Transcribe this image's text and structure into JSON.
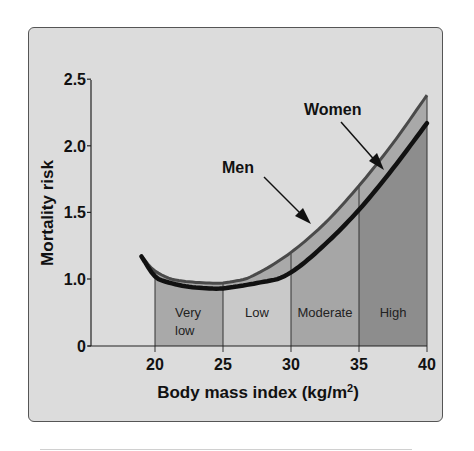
{
  "chart_data": {
    "type": "line",
    "title": "",
    "xlabel": "Body mass index (kg/m²)",
    "xlabel_main": "Body mass index (kg/m",
    "xlabel_sup": "2",
    "xlabel_close": ")",
    "ylabel": "Mortality risk",
    "xlim": [
      19,
      40
    ],
    "ylim": [
      0,
      2.5
    ],
    "grid": false,
    "x_ticks": [
      "20",
      "25",
      "30",
      "35",
      "40"
    ],
    "x_tick_values": [
      20,
      25,
      30,
      35,
      40
    ],
    "y_ticks": [
      "0",
      "1.0",
      "1.5",
      "2.0",
      "2.5"
    ],
    "y_tick_values": [
      0,
      1.0,
      1.5,
      2.0,
      2.5
    ],
    "x": [
      19,
      20,
      22,
      24,
      25,
      27.5,
      30,
      32.5,
      35,
      37.5,
      40
    ],
    "series": [
      {
        "name": "Men",
        "values": [
          1.17,
          1.06,
          0.97,
          0.94,
          0.94,
          1.04,
          1.2,
          1.42,
          1.7,
          2.02,
          2.38
        ],
        "color": "#4a4a4a"
      },
      {
        "name": "Women",
        "values": [
          1.17,
          1.02,
          0.9,
          0.86,
          0.86,
          0.94,
          1.05,
          1.26,
          1.52,
          1.83,
          2.17
        ],
        "color": "#111111"
      }
    ],
    "regions": [
      {
        "label": "Very low",
        "label_lines": [
          "Very",
          "low"
        ],
        "x_start": 20,
        "x_end": 25,
        "color": "#a9a9a9"
      },
      {
        "label": "Low",
        "label_lines": [
          "Low"
        ],
        "x_start": 25,
        "x_end": 30,
        "color": "#c9c9c9"
      },
      {
        "label": "Moderate",
        "label_lines": [
          "Moderate"
        ],
        "x_start": 30,
        "x_end": 35,
        "color": "#a6a6a6"
      },
      {
        "label": "High",
        "label_lines": [
          "High"
        ],
        "x_start": 35,
        "x_end": 40,
        "color": "#8d8d8d"
      }
    ],
    "annotations": [
      {
        "text": "Men",
        "points_to": "Men"
      },
      {
        "text": "Women",
        "points_to": "Women"
      }
    ],
    "legend": "none (inline arrow labels)"
  }
}
